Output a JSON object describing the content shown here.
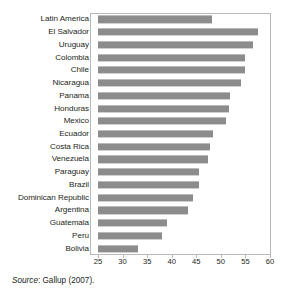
{
  "chart_data": {
    "type": "bar",
    "orientation": "horizontal",
    "title": "",
    "subtitle": "",
    "xlabel": "",
    "ylabel": "",
    "xlim": [
      25,
      60
    ],
    "xticks": [
      25,
      30,
      35,
      40,
      45,
      50,
      55,
      60
    ],
    "xtick_labels": [
      "25",
      "30",
      "35",
      "40",
      "45",
      "50",
      "55",
      "60"
    ],
    "grid": false,
    "legend": null,
    "bar_color": "#8c8c8c",
    "frame_color": "#b9b9b9",
    "categories": [
      "Latin America",
      "El Salvador",
      "Uruguay",
      "Colombia",
      "Chile",
      "Nicaragua",
      "Panama",
      "Honduras",
      "Mexico",
      "Ecuador",
      "Costa Rica",
      "Venezuela",
      "Paraguay",
      "Brazil",
      "Dominican Republic",
      "Argentina",
      "Guatemala",
      "Peru",
      "Bolivia"
    ],
    "values": [
      48.2,
      57.5,
      56.6,
      55.0,
      55.0,
      54.1,
      51.8,
      51.6,
      51.0,
      48.5,
      47.8,
      47.4,
      45.6,
      45.5,
      44.4,
      43.4,
      39.1,
      38.0,
      33.2
    ]
  },
  "source": {
    "word": "Source",
    "rest": ": Gallup (2007)."
  }
}
